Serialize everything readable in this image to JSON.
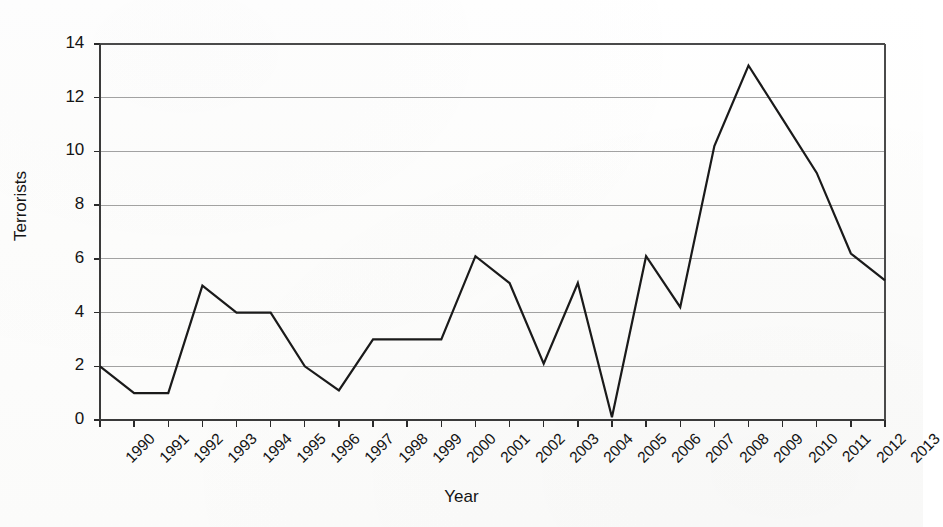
{
  "chart_data": {
    "type": "line",
    "title": "",
    "xlabel": "Year",
    "ylabel": "Terrorists",
    "categories": [
      "1990",
      "1991",
      "1992",
      "1993",
      "1994",
      "1995",
      "1996",
      "1997",
      "1998",
      "1999",
      "2000",
      "2001",
      "2002",
      "2003",
      "2004",
      "2005",
      "2006",
      "2007",
      "2008",
      "2009",
      "2010",
      "2011",
      "2012",
      "2013"
    ],
    "values": [
      2.0,
      1.0,
      1.0,
      5.0,
      4.0,
      4.0,
      2.0,
      1.1,
      3.0,
      3.0,
      3.0,
      6.1,
      5.1,
      2.1,
      5.1,
      0.1,
      6.1,
      4.2,
      10.2,
      13.2,
      11.2,
      9.2,
      6.2,
      5.2
    ],
    "series": [
      {
        "name": "Terrorists",
        "values": [
          2.0,
          1.0,
          1.0,
          5.0,
          4.0,
          4.0,
          2.0,
          1.1,
          3.0,
          3.0,
          3.0,
          6.1,
          5.1,
          2.1,
          5.1,
          0.1,
          6.1,
          4.2,
          10.2,
          13.2,
          11.2,
          9.2,
          6.2,
          5.2
        ],
        "color": "#1a1a1a"
      }
    ],
    "yticks": [
      0,
      2,
      4,
      6,
      8,
      10,
      12,
      14
    ],
    "ytick_labels": [
      "0",
      "2",
      "4",
      "6",
      "8",
      "10",
      "12",
      "14"
    ],
    "ylim": [
      0,
      14
    ],
    "xlim": [
      "1990",
      "2013"
    ],
    "grid": "horizontal",
    "grid_color": "#808080",
    "legend": "none",
    "marker": "none",
    "line_width": 2.2,
    "frame": "box"
  },
  "axes": {
    "y_axis_title": "Terrorists",
    "x_axis_title": "Year"
  }
}
